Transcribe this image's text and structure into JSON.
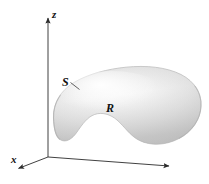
{
  "figure": {
    "kind": "3d-solid-region-diagram",
    "background_color": "#ffffff",
    "axes": {
      "color": "#2b2b2b",
      "origin": {
        "x": 48,
        "y": 157
      },
      "items": [
        {
          "name": "z-axis",
          "label": "z",
          "direction": "up",
          "tip": {
            "x": 48,
            "y": 14
          },
          "arrowhead": true
        },
        {
          "name": "x-axis",
          "label": "x",
          "direction": "down-left",
          "tip": {
            "x": 15,
            "y": 170
          },
          "arrowhead": true
        },
        {
          "name": "y-axis",
          "label": "",
          "direction": "right",
          "tip": {
            "x": 172,
            "y": 166
          },
          "arrowhead": true
        }
      ]
    },
    "solid": {
      "name": "kidney-shaped-solid",
      "surface_label": "S",
      "region_label": "R",
      "fill_light": "#fdfdfd",
      "fill_mid": "#e2e2e2",
      "fill_dark": "#bfbfbf",
      "outline_color": "#b3b3b3",
      "leader_line_color": "#3a3a3a"
    },
    "labels": {
      "z": "z",
      "x": "x",
      "surface": "S",
      "region": "R"
    }
  }
}
